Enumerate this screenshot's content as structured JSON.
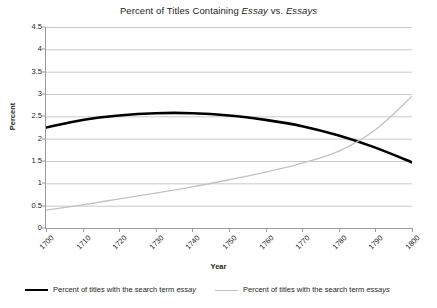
{
  "chart_data": {
    "type": "line",
    "title": "Percent of Titles Containing Essay vs. Essays",
    "title_parts": [
      {
        "text": "Percent of Titles Containing ",
        "italic": false
      },
      {
        "text": "Essay",
        "italic": true
      },
      {
        "text": " vs. ",
        "italic": false
      },
      {
        "text": "Essays",
        "italic": true
      }
    ],
    "xlabel": "Year",
    "ylabel": "Percent",
    "xlim": [
      1700,
      1800
    ],
    "ylim": [
      0,
      4.5
    ],
    "ytick_step": 0.5,
    "xtick_step": 10,
    "grid": "horizontal",
    "legend_position": "bottom",
    "ytick_labels": [
      "0",
      "0.5",
      "1",
      "1.5",
      "2",
      "2.5",
      "3",
      "3.5",
      "4",
      "4.5"
    ],
    "ytick_values": [
      0,
      0.5,
      1,
      1.5,
      2,
      2.5,
      3,
      3.5,
      4,
      4.5
    ],
    "xtick_labels": [
      "1700",
      "1710",
      "1720",
      "1730",
      "1740",
      "1750",
      "1760",
      "1770",
      "1780",
      "1790",
      "1800"
    ],
    "xtick_values": [
      1700,
      1710,
      1720,
      1730,
      1740,
      1750,
      1760,
      1770,
      1780,
      1790,
      1800
    ],
    "x": [
      1700,
      1710,
      1720,
      1730,
      1740,
      1750,
      1760,
      1770,
      1780,
      1790,
      1800
    ],
    "series": [
      {
        "name": "Percent of titles with the search term essay",
        "legend_parts": [
          {
            "text": "Percent of titles with the search term ",
            "italic": false
          },
          {
            "text": "essay",
            "italic": true
          }
        ],
        "color": "#000000",
        "width": 2.6,
        "values": [
          2.25,
          2.42,
          2.52,
          2.57,
          2.57,
          2.52,
          2.42,
          2.28,
          2.07,
          1.8,
          1.47
        ]
      },
      {
        "name": "Percent of titles with the search term essays",
        "legend_parts": [
          {
            "text": "Percent of titles with the search term ",
            "italic": false
          },
          {
            "text": "essays",
            "italic": true
          }
        ],
        "color": "#c2c2c2",
        "width": 1.3,
        "values": [
          0.4,
          0.52,
          0.65,
          0.78,
          0.92,
          1.08,
          1.25,
          1.45,
          1.72,
          2.2,
          2.95
        ]
      }
    ],
    "annotations": [],
    "crossing_point": {
      "year": 1785,
      "percent": 1.9
    }
  }
}
